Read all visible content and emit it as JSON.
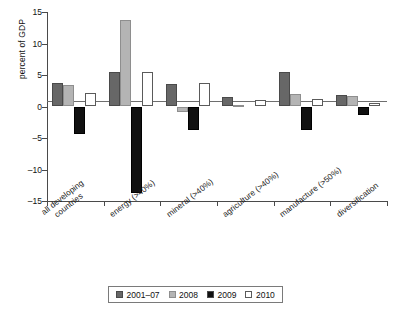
{
  "chart_data": {
    "type": "bar",
    "title": "",
    "xlabel": "",
    "ylabel": "percent of GDP",
    "ylim": [
      -15,
      15
    ],
    "yticks": [
      15,
      10,
      5,
      0,
      -5,
      -10,
      -15
    ],
    "ytick_labels": [
      "15",
      "10",
      "5",
      "0",
      "–5",
      "–10",
      "–15"
    ],
    "grid": false,
    "legend_position": "bottom-center",
    "categories": [
      "all developing countries",
      "energy (>40%)",
      "mineral (>40%)",
      "agriculture (>40%)",
      "manufacture (>50%)",
      "diversification"
    ],
    "series": [
      {
        "name": "2001–07",
        "color": "#676767",
        "values": [
          3.7,
          5.5,
          3.6,
          1.5,
          5.5,
          1.9
        ]
      },
      {
        "name": "2008",
        "color": "#b4b4b4",
        "values": [
          3.4,
          13.8,
          -0.9,
          0.3,
          2.0,
          1.6
        ]
      },
      {
        "name": "2009",
        "color": "#111111",
        "values": [
          -4.4,
          -13.7,
          -3.8,
          0.0,
          -3.8,
          -1.3
        ]
      },
      {
        "name": "2010",
        "color": "#ffffff",
        "values": [
          2.1,
          5.5,
          3.8,
          1.0,
          1.2,
          0.6
        ]
      }
    ]
  },
  "axis": {
    "y_title": "percent of GDP"
  },
  "legend": {
    "items": [
      {
        "label": "2001–07",
        "swatch": "swatch-dark-gray"
      },
      {
        "label": "2008",
        "swatch": "swatch-light-gray"
      },
      {
        "label": "2009",
        "swatch": "swatch-black"
      },
      {
        "label": "2010",
        "swatch": "swatch-white"
      }
    ]
  }
}
